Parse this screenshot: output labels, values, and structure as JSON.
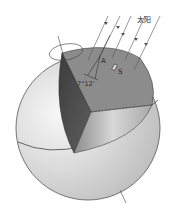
{
  "figure": {
    "labels": {
      "sun": "太阳",
      "point_a": "A",
      "point_s": "S",
      "angle": "7°12'"
    },
    "colors": {
      "sphere": "#cfcfcf",
      "sphere_highlight": "#f2f2f2",
      "cut_face_top": "#8a8a8a",
      "cut_face_left": "#4a4a4a",
      "cut_face_right": "#b8b8b8",
      "lines": "#3a3a3a"
    },
    "sun_rays_count": 5
  }
}
